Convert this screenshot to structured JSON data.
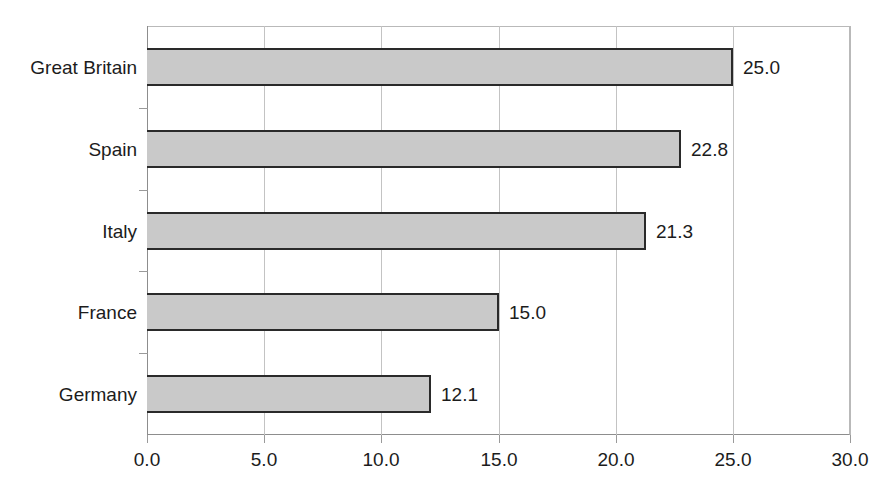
{
  "chart_data": {
    "type": "bar",
    "orientation": "horizontal",
    "title": "",
    "subtitle": "",
    "xlabel": "",
    "ylabel": "",
    "xlim": [
      0.0,
      30.0
    ],
    "xticks": [
      "0.0",
      "5.0",
      "10.0",
      "15.0",
      "20.0",
      "25.0",
      "30.0"
    ],
    "xtick_values": [
      0,
      5,
      10,
      15,
      20,
      25,
      30
    ],
    "grid": "vertical",
    "legend": "none",
    "categories": [
      "Great Britain",
      "Spain",
      "Italy",
      "France",
      "Germany"
    ],
    "values": [
      25.0,
      22.8,
      21.3,
      15.0,
      12.1
    ],
    "data_labels": [
      "25.0",
      "22.8",
      "21.3",
      "15.0",
      "12.1"
    ],
    "bars": [
      {
        "category": "Great Britain",
        "value": 25.0,
        "label": "25.0"
      },
      {
        "category": "Spain",
        "value": 22.8,
        "label": "22.8"
      },
      {
        "category": "Italy",
        "value": 21.3,
        "label": "21.3"
      },
      {
        "category": "France",
        "value": 15.0,
        "label": "15.0"
      },
      {
        "category": "Germany",
        "value": 12.1,
        "label": "12.1"
      }
    ],
    "colors": {
      "bar_fill": "#c9c9c9",
      "bar_border": "#2a2a2a",
      "gridline": "#c3c3c3",
      "axis": "#8d8d8d",
      "text": "#1c1c1c",
      "background": "#ffffff"
    }
  }
}
